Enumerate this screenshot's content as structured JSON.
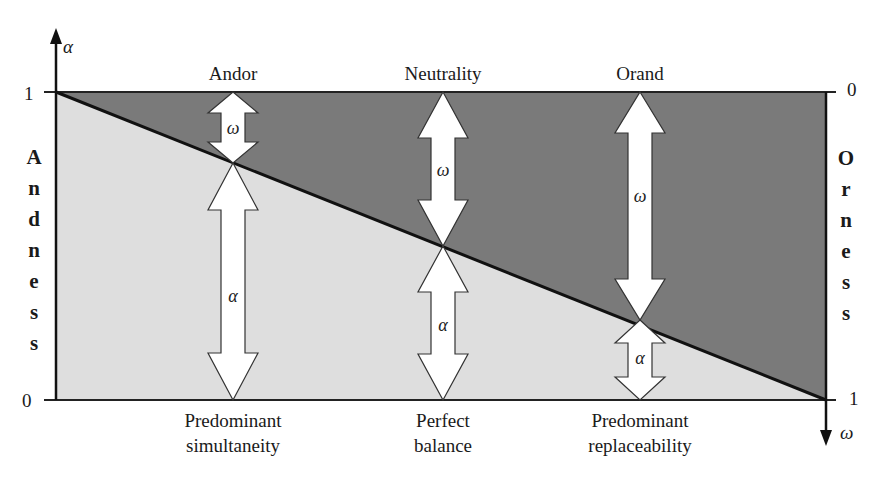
{
  "diagram": {
    "left_axis": {
      "symbol": "α",
      "tick_top": "1",
      "tick_bottom": "0",
      "label_letters": [
        "A",
        "n",
        "d",
        "n",
        "e",
        "s",
        "s"
      ],
      "label": "Andness"
    },
    "right_axis": {
      "symbol": "ω",
      "tick_top": "0",
      "tick_bottom": "1",
      "label_letters": [
        "O",
        "r",
        "n",
        "e",
        "s",
        "s"
      ],
      "label": "Orness"
    },
    "columns": [
      {
        "top_label": "Andor",
        "upper_arrow_symbol": "ω",
        "lower_arrow_symbol": "α",
        "bottom_label_line1": "Predominant",
        "bottom_label_line2": "simultaneity"
      },
      {
        "top_label": "Neutrality",
        "upper_arrow_symbol": "ω",
        "lower_arrow_symbol": "α",
        "bottom_label_line1": "Perfect",
        "bottom_label_line2": "balance"
      },
      {
        "top_label": "Orand",
        "upper_arrow_symbol": "ω",
        "lower_arrow_symbol": "α",
        "bottom_label_line1": "Predominant",
        "bottom_label_line2": "replaceability"
      }
    ],
    "colors": {
      "upper_region": "#7a7a7a",
      "lower_region": "#dedede",
      "line": "#111111",
      "arrow_fill": "#ffffff"
    }
  }
}
